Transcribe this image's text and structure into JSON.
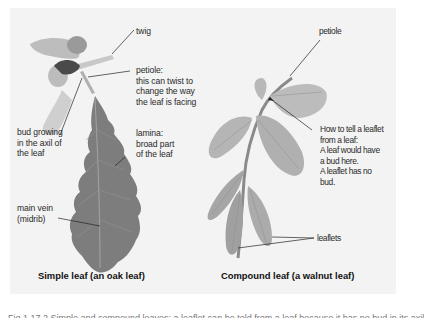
{
  "figure": {
    "background": "#ffffff",
    "panel_color": "#f3f3f3",
    "leaf_dark": "#7a7a7a",
    "leaf_light": "#b3b3b3",
    "caption": "Fig 1.17.2  Simple and compound leaves: a leaflet can be told from a leaf because it has no bud in its axil"
  },
  "simple_leaf": {
    "title": "Simple leaf (an oak leaf)",
    "labels": {
      "twig": "twig",
      "petiole": [
        "petiole:",
        "this can twist to",
        "change the way",
        "the leaf is facing"
      ],
      "bud": [
        "bud growing",
        "in the axil of",
        "the leaf"
      ],
      "lamina": [
        "lamina:",
        "broad part",
        "of the leaf"
      ],
      "main_vein": [
        "main vein",
        "(midrib)"
      ]
    }
  },
  "compound_leaf": {
    "title": "Compound leaf (a walnut leaf)",
    "labels": {
      "petiole": "petiole",
      "leaflet_note": [
        "How to tell a leaflet",
        "from a leaf:",
        "A leaf would have",
        "a bud here.",
        "A leaflet has no",
        "bud."
      ],
      "leaflets": "leaflets"
    }
  }
}
